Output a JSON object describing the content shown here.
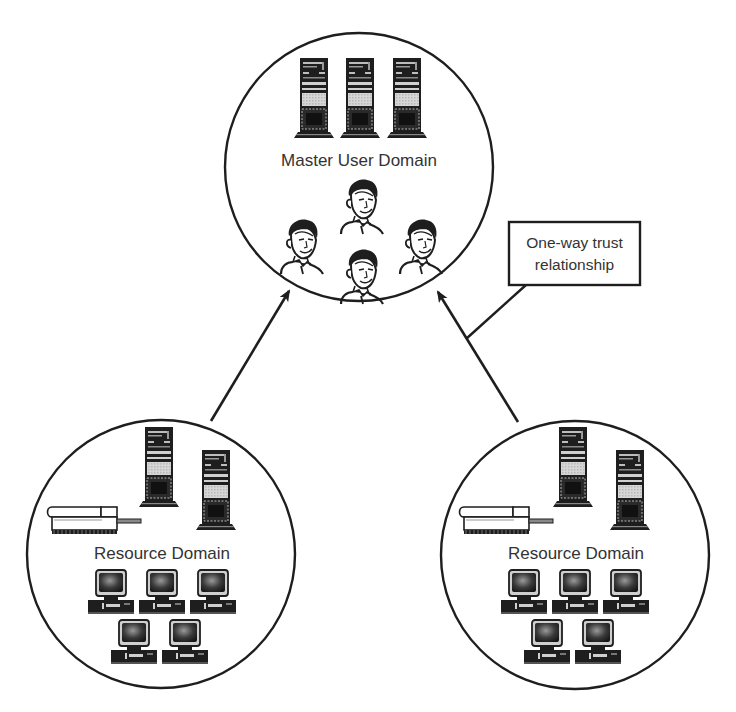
{
  "diagram": {
    "master": {
      "label": "Master User Domain",
      "servers": 3,
      "users": 4
    },
    "resource_left": {
      "label": "Resource Domain",
      "servers": 2,
      "printers": 1,
      "computers": 5
    },
    "resource_right": {
      "label": "Resource Domain",
      "servers": 2,
      "printers": 1,
      "computers": 5
    },
    "callout": {
      "line1": "One-way trust",
      "line2": "relationship"
    },
    "colors": {
      "stroke": "#222222",
      "fill_dark": "#1e1e1e",
      "fill_light": "#cfcfcf",
      "background": "#ffffff"
    }
  }
}
